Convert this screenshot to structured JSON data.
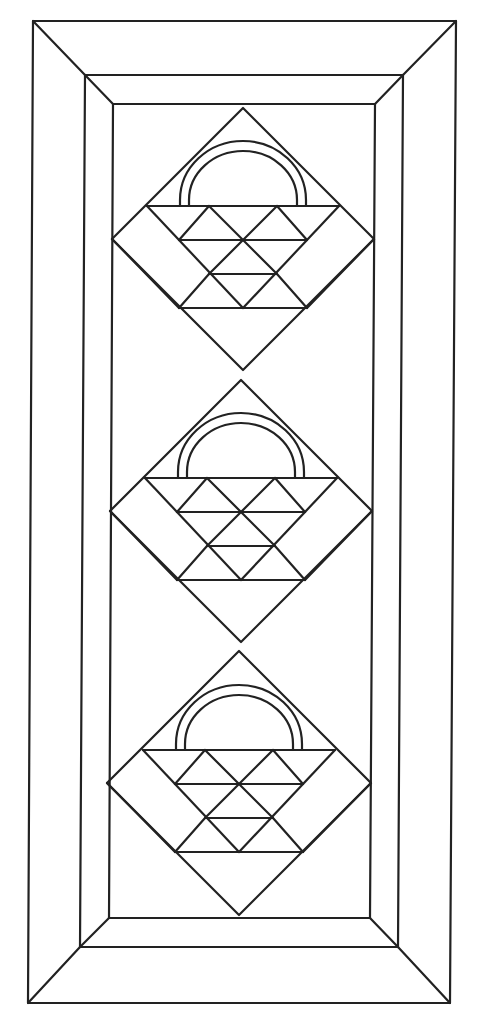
{
  "title": "Basket quilt pattern line drawing",
  "colors": {
    "background": "#ffffff",
    "stroke": "#222222"
  },
  "frame": {
    "outer": {
      "tl": [
        33,
        21
      ],
      "tr": [
        456,
        21
      ],
      "br": [
        450,
        1003
      ],
      "bl": [
        28,
        1003
      ]
    },
    "middle": {
      "tl": [
        85,
        75
      ],
      "tr": [
        403,
        75
      ],
      "br": [
        398,
        947
      ],
      "bl": [
        80,
        947
      ]
    },
    "inner": {
      "tl": [
        113,
        104
      ],
      "tr": [
        375,
        104
      ],
      "br": [
        370,
        918
      ],
      "bl": [
        109,
        918
      ]
    }
  },
  "blocks": [
    {
      "name": "basket-block-1",
      "cx": 243,
      "cy": 239,
      "half": 131
    },
    {
      "name": "basket-block-2",
      "cx": 241,
      "cy": 511,
      "half": 131
    },
    {
      "name": "basket-block-3",
      "cx": 239,
      "cy": 783,
      "half": 132
    }
  ],
  "basket_geometry": {
    "top_bar_dy": -33,
    "top_bar_half_width": 96,
    "row_spacing": 34,
    "cell_half": 32,
    "handle_outer_r": 65,
    "handle_inner_r": 55,
    "handle_outer_half_span": 63,
    "handle_inner_half_span": 54
  }
}
